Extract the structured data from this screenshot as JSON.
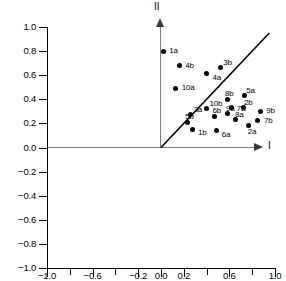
{
  "chart_data": {
    "type": "scatter",
    "title": "",
    "subtitle": "",
    "xlabel": "I",
    "ylabel": "II",
    "xlim": [
      -1.0,
      1.0
    ],
    "ylim": [
      -1.0,
      1.0
    ],
    "grid": false,
    "legend": null,
    "legend_position": "none",
    "x_ticks": [
      -1.0,
      -0.8,
      -0.6,
      -0.4,
      -0.2,
      0.0,
      0.2,
      0.4,
      0.6,
      0.8,
      1.0
    ],
    "x_tick_labels": [
      "-1.0",
      "",
      "-0.6",
      "",
      "-0.2",
      "0.0",
      "0.2",
      "",
      "0.6",
      "",
      "1.0"
    ],
    "y_ticks": [
      -1.0,
      -0.8,
      -0.6,
      -0.4,
      -0.2,
      0.0,
      0.2,
      0.4,
      0.6,
      0.8,
      1.0
    ],
    "y_tick_labels": [
      "-1.0",
      "-0.8",
      "-0.6",
      "-0.4",
      "-0.2",
      "0.0",
      "0.2",
      "0.4",
      "0.6",
      "0.8",
      "1.0"
    ],
    "annotations": [
      {
        "name": "identity-line",
        "type": "line",
        "x0": 0.0,
        "y0": 0.0,
        "x1": 0.95,
        "y1": 0.95
      }
    ],
    "point_color": "#000000",
    "axis_arrow_color": "#7d7d7d",
    "points": [
      {
        "label": "1a",
        "x": 0.02,
        "y": 0.8,
        "label_dx": 6,
        "label_dy": -3
      },
      {
        "label": "4b",
        "x": 0.16,
        "y": 0.68,
        "label_dx": 6,
        "label_dy": -3
      },
      {
        "label": "3b",
        "x": 0.52,
        "y": 0.66,
        "label_dx": 3,
        "label_dy": -8
      },
      {
        "label": "4a",
        "x": 0.4,
        "y": 0.61,
        "label_dx": 6,
        "label_dy": 1
      },
      {
        "label": "10a",
        "x": 0.13,
        "y": 0.49,
        "label_dx": 6,
        "label_dy": -3
      },
      {
        "label": "5a",
        "x": 0.73,
        "y": 0.43,
        "label_dx": 2,
        "label_dy": -8
      },
      {
        "label": "8b",
        "x": 0.58,
        "y": 0.4,
        "label_dx": -2,
        "label_dy": -8
      },
      {
        "label": "2b",
        "x": 0.72,
        "y": 0.33,
        "label_dx": 1,
        "label_dy": -8
      },
      {
        "label": "7a",
        "x": 0.62,
        "y": 0.33,
        "label_dx": 5,
        "label_dy": -2
      },
      {
        "label": "10b",
        "x": 0.4,
        "y": 0.32,
        "label_dx": 3,
        "label_dy": -8
      },
      {
        "label": "9b",
        "x": 0.87,
        "y": 0.3,
        "label_dx": 6,
        "label_dy": -3
      },
      {
        "label": "9a",
        "x": 0.58,
        "y": 0.28,
        "label_dx": -1,
        "label_dy": -8
      },
      {
        "label": "3a",
        "x": 0.26,
        "y": 0.27,
        "label_dx": 3,
        "label_dy": -8
      },
      {
        "label": "6b",
        "x": 0.47,
        "y": 0.26,
        "label_dx": -2,
        "label_dy": -8
      },
      {
        "label": "8a",
        "x": 0.65,
        "y": 0.23,
        "label_dx": 0,
        "label_dy": -8
      },
      {
        "label": "7b",
        "x": 0.85,
        "y": 0.22,
        "label_dx": 6,
        "label_dy": -3
      },
      {
        "label": "5b",
        "x": 0.23,
        "y": 0.21,
        "label_dx": -2,
        "label_dy": -8
      },
      {
        "label": "2a",
        "x": 0.77,
        "y": 0.18,
        "label_dx": -1,
        "label_dy": 3
      },
      {
        "label": "1b",
        "x": 0.28,
        "y": 0.15,
        "label_dx": 5,
        "label_dy": 1
      },
      {
        "label": "6a",
        "x": 0.49,
        "y": 0.14,
        "label_dx": 5,
        "label_dy": 1
      }
    ]
  },
  "axes": {
    "vertical_axis_label": "II",
    "horizontal_axis_label": "I"
  }
}
